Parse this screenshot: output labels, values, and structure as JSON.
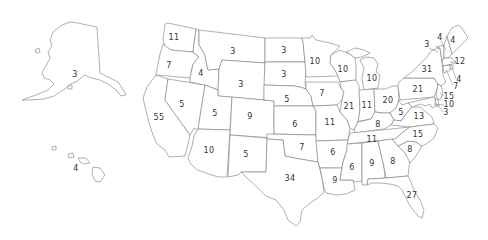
{
  "map": {
    "type": "us-states-choropleth-labels",
    "stroke_color": "#7a7a7a",
    "fill_color": "#ffffff",
    "label_color": "#333333"
  },
  "states": [
    {
      "abbr": "AK",
      "value": "3",
      "x": 75,
      "y": 75
    },
    {
      "abbr": "HI",
      "value": "4",
      "x": 76,
      "y": 169
    },
    {
      "abbr": "WA",
      "value": "11",
      "x": 174,
      "y": 38
    },
    {
      "abbr": "OR",
      "value": "7",
      "x": 169,
      "y": 66
    },
    {
      "abbr": "CA",
      "value": "55",
      "x": 159,
      "y": 118
    },
    {
      "abbr": "NV",
      "value": "5",
      "x": 182,
      "y": 105
    },
    {
      "abbr": "ID",
      "value": "4",
      "x": 201,
      "y": 74
    },
    {
      "abbr": "MT",
      "value": "3",
      "x": 233,
      "y": 52
    },
    {
      "abbr": "WY",
      "value": "3",
      "x": 241,
      "y": 85
    },
    {
      "abbr": "UT",
      "value": "5",
      "x": 215,
      "y": 114
    },
    {
      "abbr": "CO",
      "value": "9",
      "x": 250,
      "y": 117
    },
    {
      "abbr": "AZ",
      "value": "10",
      "x": 209,
      "y": 151
    },
    {
      "abbr": "NM",
      "value": "5",
      "x": 246,
      "y": 155
    },
    {
      "abbr": "ND",
      "value": "3",
      "x": 284,
      "y": 51
    },
    {
      "abbr": "SD",
      "value": "3",
      "x": 284,
      "y": 75
    },
    {
      "abbr": "NE",
      "value": "5",
      "x": 287,
      "y": 100
    },
    {
      "abbr": "KS",
      "value": "6",
      "x": 295,
      "y": 125
    },
    {
      "abbr": "OK",
      "value": "7",
      "x": 302,
      "y": 148
    },
    {
      "abbr": "TX",
      "value": "34",
      "x": 290,
      "y": 179
    },
    {
      "abbr": "MN",
      "value": "10",
      "x": 315,
      "y": 62
    },
    {
      "abbr": "IA",
      "value": "7",
      "x": 322,
      "y": 94
    },
    {
      "abbr": "MO",
      "value": "11",
      "x": 330,
      "y": 123
    },
    {
      "abbr": "AR",
      "value": "6",
      "x": 333,
      "y": 153
    },
    {
      "abbr": "LA",
      "value": "9",
      "x": 335,
      "y": 181
    },
    {
      "abbr": "WI",
      "value": "10",
      "x": 343,
      "y": 70
    },
    {
      "abbr": "IL",
      "value": "21",
      "x": 349,
      "y": 107
    },
    {
      "abbr": "MI",
      "value": "10",
      "x": 372,
      "y": 79
    },
    {
      "abbr": "IN",
      "value": "11",
      "x": 367,
      "y": 106
    },
    {
      "abbr": "OH",
      "value": "20",
      "x": 388,
      "y": 101
    },
    {
      "abbr": "KY",
      "value": "8",
      "x": 378,
      "y": 125
    },
    {
      "abbr": "TN",
      "value": "11",
      "x": 372,
      "y": 140
    },
    {
      "abbr": "MS",
      "value": "6",
      "x": 352,
      "y": 168
    },
    {
      "abbr": "AL",
      "value": "9",
      "x": 372,
      "y": 164
    },
    {
      "abbr": "GA",
      "value": "8",
      "x": 393,
      "y": 162
    },
    {
      "abbr": "FL",
      "value": "27",
      "x": 412,
      "y": 196
    },
    {
      "abbr": "SC",
      "value": "8",
      "x": 410,
      "y": 150
    },
    {
      "abbr": "NC",
      "value": "15",
      "x": 418,
      "y": 135
    },
    {
      "abbr": "VA",
      "value": "13",
      "x": 419,
      "y": 117
    },
    {
      "abbr": "WV",
      "value": "5",
      "x": 401,
      "y": 113
    },
    {
      "abbr": "PA",
      "value": "21",
      "x": 418,
      "y": 90
    },
    {
      "abbr": "NY",
      "value": "31",
      "x": 427,
      "y": 70
    },
    {
      "abbr": "VT",
      "value": "3",
      "x": 427,
      "y": 45
    },
    {
      "abbr": "NH",
      "value": "4",
      "x": 440,
      "y": 38
    },
    {
      "abbr": "ME",
      "value": "4",
      "x": 453,
      "y": 41
    },
    {
      "abbr": "MA",
      "value": "12",
      "x": 460,
      "y": 62
    },
    {
      "abbr": "RI",
      "value": "4",
      "x": 459,
      "y": 80
    },
    {
      "abbr": "CT",
      "value": "7",
      "x": 456,
      "y": 87
    },
    {
      "abbr": "NJ",
      "value": "15",
      "x": 449,
      "y": 97
    },
    {
      "abbr": "MD",
      "value": "10",
      "x": 449,
      "y": 105
    },
    {
      "abbr": "DE",
      "value": "3",
      "x": 446,
      "y": 113
    }
  ]
}
